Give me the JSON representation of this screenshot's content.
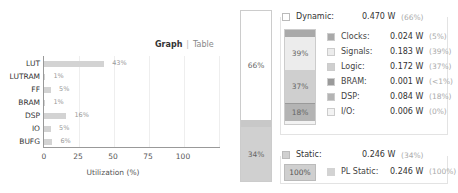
{
  "utilization": {
    "view_toggle": {
      "active": "Graph",
      "inactive": "Table"
    },
    "xlabel": "Utilization (%)",
    "xticks": [
      "0",
      "25",
      "50",
      "75",
      "100"
    ]
  },
  "chart_data": {
    "type": "bar",
    "orientation": "horizontal",
    "title": "",
    "xlabel": "Utilization (%)",
    "ylabel": "",
    "xlim": [
      0,
      126
    ],
    "categories": [
      "LUT",
      "LUTRAM",
      "FF",
      "BRAM",
      "DSP",
      "IO",
      "BUFG"
    ],
    "values": [
      43,
      1,
      5,
      1,
      16,
      5,
      6
    ],
    "labels": [
      "43%",
      "1%",
      "5%",
      "1%",
      "16%",
      "5%",
      "6%"
    ]
  },
  "power": {
    "total_bar": {
      "dynamic_pct": "66%",
      "static_pct": "34%"
    },
    "dynamic": {
      "label": "Dynamic:",
      "value": "0.470 W",
      "pct": "(66%)",
      "stack_labels": {
        "signals": "39%",
        "logic": "37%",
        "dsp": "18%"
      },
      "items": [
        {
          "label": "Clocks:",
          "value": "0.024 W",
          "pct": "(5%)",
          "color": "#a9a9a9"
        },
        {
          "label": "Signals:",
          "value": "0.183 W",
          "pct": "(39%)",
          "color": "#ececec"
        },
        {
          "label": "Logic:",
          "value": "0.172 W",
          "pct": "(37%)",
          "color": "#cfcfcf"
        },
        {
          "label": "BRAM:",
          "value": "0.001 W",
          "pct": "(<1%)",
          "color": "#9a9a9a"
        },
        {
          "label": "DSP:",
          "value": "0.084 W",
          "pct": "(18%)",
          "color": "#b4b4b4"
        },
        {
          "label": "I/O:",
          "value": "0.006 W",
          "pct": "(0%)",
          "color": "#f3f3f3"
        }
      ]
    },
    "static": {
      "label": "Static:",
      "value": "0.246 W",
      "pct": "(34%)",
      "box_label": "100%",
      "items": [
        {
          "label": "PL Static:",
          "value": "0.246 W",
          "pct": "(100%)",
          "color": "#d3d3d3"
        }
      ]
    }
  }
}
